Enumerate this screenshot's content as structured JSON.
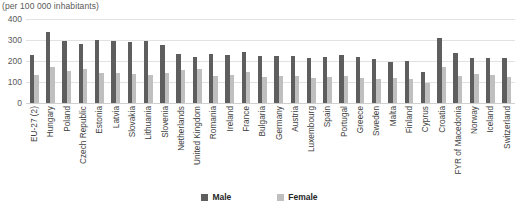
{
  "caption": "(per 100 000 inhabitants)",
  "colors": {
    "male": "#5e5e5e",
    "female": "#bfbfbf",
    "gridline": "#e2e2e2",
    "text": "#404040"
  },
  "legend": {
    "items": [
      {
        "label": "Male",
        "key": "male"
      },
      {
        "label": "Female",
        "key": "female"
      }
    ]
  },
  "axis": {
    "yticks": [
      "400",
      "300",
      "200",
      "100",
      "0"
    ]
  },
  "chart_data": {
    "type": "bar",
    "title": "",
    "subtitle": "(per 100 000 inhabitants)",
    "xlabel": "",
    "ylabel": "",
    "ylim": [
      0,
      400
    ],
    "ytick_values": [
      0,
      100,
      200,
      300,
      400
    ],
    "grid": true,
    "legend_position": "bottom",
    "categories": [
      "EU-27 (2)",
      "Hungary",
      "Poland",
      "Czech Republic",
      "Estonia",
      "Latvia",
      "Slovakia",
      "Lithuania",
      "Slovenia",
      "Netherlands",
      "United Kingdom",
      "Romania",
      "Ireland",
      "France",
      "Bulgaria",
      "Germany",
      "Austria",
      "Luxembourg",
      "Spain",
      "Portugal",
      "Greece",
      "Sweden",
      "Malta",
      "Finland",
      "Cyprus",
      "Croatia",
      "FYR of Macedonia",
      "Norway",
      "Iceland",
      "Switzerland"
    ],
    "series": [
      {
        "name": "Male",
        "values": [
          230,
          337,
          293,
          283,
          299,
          297,
          292,
          297,
          278,
          234,
          220,
          232,
          228,
          243,
          225,
          222,
          222,
          215,
          217,
          228,
          218,
          208,
          196,
          198,
          150,
          310,
          240,
          215,
          215,
          212
        ]
      },
      {
        "name": "Female",
        "values": [
          132,
          172,
          152,
          160,
          141,
          145,
          140,
          134,
          143,
          155,
          160,
          128,
          135,
          150,
          122,
          130,
          127,
          118,
          123,
          128,
          120,
          115,
          120,
          112,
          95,
          170,
          128,
          138,
          132,
          122
        ]
      }
    ]
  }
}
